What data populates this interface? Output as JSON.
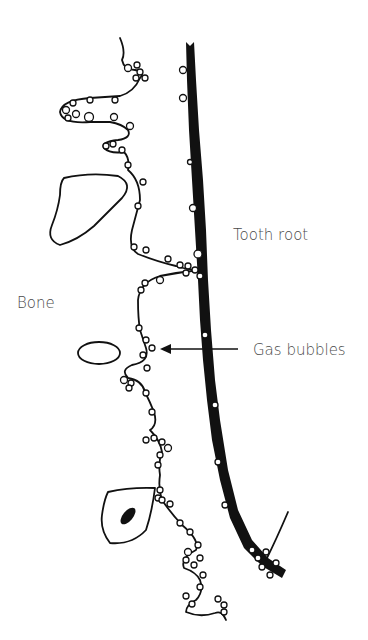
{
  "figure": {
    "type": "schematic diagram",
    "labels": {
      "tooth_root": "Tooth root",
      "bone": "Bone",
      "gas_bubbles": "Gas bubbles"
    },
    "colors": {
      "ink": "#111111",
      "label_text": "#4a4a4a",
      "background": "#ffffff"
    },
    "annotations": [
      {
        "label": "Gas bubbles",
        "arrow": "left",
        "points_to": "bubbles along bone surface"
      }
    ]
  }
}
